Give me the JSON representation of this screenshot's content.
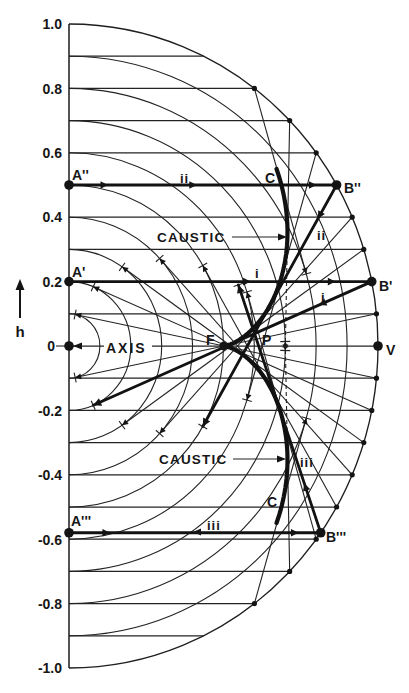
{
  "figure": {
    "y_axis": {
      "label": "h",
      "ticks": [
        {
          "value": 1.0,
          "label": "1.0"
        },
        {
          "value": 0.8,
          "label": "0.8"
        },
        {
          "value": 0.6,
          "label": "0.6"
        },
        {
          "value": 0.4,
          "label": "0.4"
        },
        {
          "value": 0.2,
          "label": "0.2"
        },
        {
          "value": 0,
          "label": "0"
        },
        {
          "value": -0.2,
          "label": "-0.2"
        },
        {
          "value": -0.4,
          "label": "-0.4"
        },
        {
          "value": -0.6,
          "label": "-0.6"
        },
        {
          "value": -0.8,
          "label": "-0.8"
        },
        {
          "value": -1.0,
          "label": "-1.0"
        }
      ]
    },
    "axis_label": "AXIS",
    "point_labels": {
      "focus": "F",
      "intersection": "P",
      "vertex": "V",
      "start_i": "A'",
      "start_ii": "A''",
      "start_iii": "A'''",
      "mirror_i": "B'",
      "mirror_ii": "B''",
      "mirror_iii": "B'''"
    },
    "caustic": {
      "label_upper": "CAUSTIC",
      "label_lower": "CAUSTIC",
      "marker_upper": "C",
      "marker_lower": "C",
      "theta_max_deg": 55
    },
    "ray_labels": {
      "i": "i",
      "ii": "ii",
      "iii": "iii"
    },
    "geometry": {
      "wavefront_radii": [
        0.1,
        0.2,
        0.3,
        0.4,
        0.5,
        0.6,
        0.7,
        0.8,
        0.9,
        1.0
      ],
      "incident_heights": [
        0.9,
        0.8,
        0.7,
        0.6,
        0.5,
        0.4,
        0.3,
        0.2,
        0.1,
        -0.1,
        -0.2,
        -0.3,
        -0.4,
        -0.5,
        -0.6,
        -0.7,
        -0.8,
        -0.9
      ],
      "reflected_heights": [
        0.8,
        0.7,
        0.6,
        0.4,
        0.3,
        0.1,
        -0.1,
        -0.2,
        -0.3,
        -0.4,
        -0.5,
        -0.6,
        -0.7,
        -0.8
      ],
      "dashed_heights": [
        0.7,
        -0.7
      ],
      "mirror_dot_heights": [
        0.8,
        0.7,
        0.6,
        0.4,
        0.3,
        0.1,
        -0.1,
        -0.2,
        -0.3,
        -0.4,
        -0.5,
        -0.6,
        -0.7,
        -0.8
      ],
      "highlighted_rays": [
        {
          "id": "i",
          "h": 0.2,
          "incident_arrows": [
            0.6,
            0.88
          ],
          "reflected_arrows": [
            0.19
          ]
        },
        {
          "id": "ii",
          "h": 0.5,
          "incident_arrows": [
            0.146,
            0.478,
            0.925
          ],
          "reflected_arrows": [
            0.14
          ]
        },
        {
          "id": "iii",
          "h": -0.58,
          "incident_arrows": [
            0.163,
            0.912
          ],
          "reflected_arrows": [
            0.2
          ]
        }
      ],
      "key_points": [
        {
          "name": "origin",
          "x": 0,
          "h": 0
        },
        {
          "name": "focus",
          "x": 0.5,
          "h": 0
        },
        {
          "name": "vertex",
          "x": 1.0,
          "h": 0
        }
      ]
    }
  }
}
